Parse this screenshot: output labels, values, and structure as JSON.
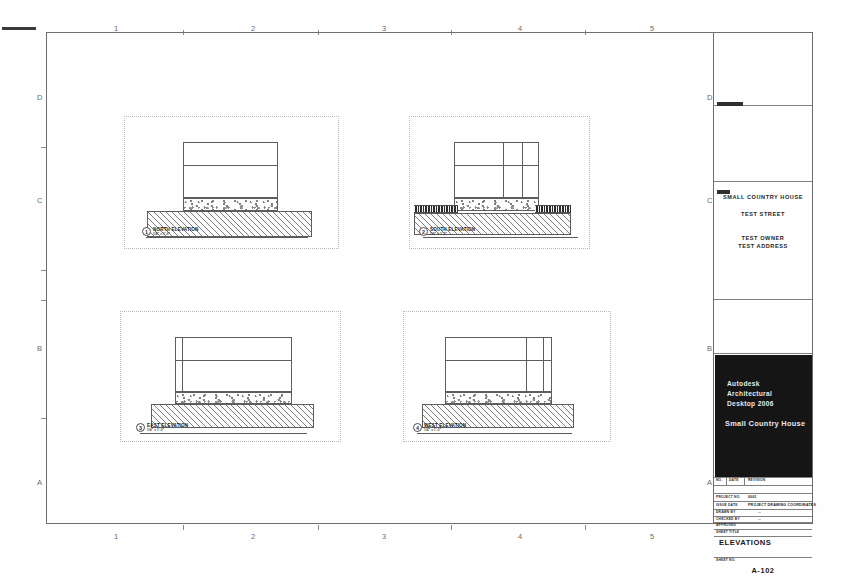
{
  "sheet": {
    "width": 849,
    "height": 576,
    "background_color": "#ffffff",
    "frame_color": "#6e6e6e"
  },
  "grid": {
    "columns": [
      "1",
      "2",
      "3",
      "4",
      "5"
    ],
    "rows": [
      "D",
      "C",
      "B",
      "A"
    ]
  },
  "viewports": [
    {
      "name": "north-elevation-viewport",
      "label_number": "1",
      "label_text": "NORTH ELEVATION",
      "label_scale": "1/4\" = 1'-0\""
    },
    {
      "name": "south-elevation-viewport",
      "label_number": "2",
      "label_text": "SOUTH ELEVATION",
      "label_scale": "1/4\" = 1'-0\""
    },
    {
      "name": "east-elevation-viewport",
      "label_number": "3",
      "label_text": "EAST ELEVATION",
      "label_scale": "1/4\" = 1'-0\""
    },
    {
      "name": "west-elevation-viewport",
      "label_number": "4",
      "label_text": "WEST ELEVATION",
      "label_scale": "1/4\" = 1'-0\""
    }
  ],
  "titleblock": {
    "project_name": "SMALL COUNTRY HOUSE",
    "project_street": "TEST STREET",
    "owner_name": "TEST OWNER",
    "owner_address": "TEST ADDRESS",
    "logo_line1": "Autodesk",
    "logo_line2": "Architectural",
    "logo_line3": "Desktop 2006",
    "logo_project": "Small Country House",
    "revision_header_no": "NO.",
    "revision_header_date": "DATE",
    "revision_header_desc": "REVISION",
    "project_no_label": "PROJECT NO.",
    "project_no_value": "0001",
    "issue_date_label": "ISSUE DATE",
    "issue_date_value": "PROJECT DRAWING COORDINATES",
    "drawn_by_label": "DRAWN BY",
    "drawn_by_value": "--",
    "checked_by_label": "CHECKED BY",
    "checked_by_value": "--",
    "approved_label": "APPROVED",
    "sheet_title_label": "SHEET TITLE",
    "sheet_title": "ELEVATIONS",
    "sheet_no_label": "SHEET NO.",
    "sheet_no": "A-102",
    "foot_left": "DATE",
    "foot_mid": "OF"
  }
}
